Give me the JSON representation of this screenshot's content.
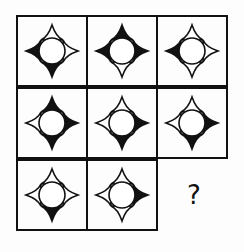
{
  "puzzle": {
    "grid": {
      "rows": 3,
      "cols": 3,
      "left": 16,
      "top": 15,
      "cell_size": 72
    },
    "colors": {
      "line": "#111111",
      "fill_black": "#111111",
      "fill_white": "#ffffff"
    },
    "cells": [
      {
        "row": 0,
        "col": 0,
        "points": {
          "top": "white",
          "right": "white",
          "bottom": "black",
          "left": "black"
        }
      },
      {
        "row": 0,
        "col": 1,
        "points": {
          "top": "black",
          "right": "black",
          "bottom": "white",
          "left": "black"
        }
      },
      {
        "row": 0,
        "col": 2,
        "points": {
          "top": "white",
          "right": "white",
          "bottom": "white",
          "left": "black"
        }
      },
      {
        "row": 1,
        "col": 0,
        "points": {
          "top": "black",
          "right": "black",
          "bottom": "black",
          "left": "white"
        }
      },
      {
        "row": 1,
        "col": 1,
        "points": {
          "top": "white",
          "right": "black",
          "bottom": "black",
          "left": "white"
        }
      },
      {
        "row": 1,
        "col": 2,
        "points": {
          "top": "white",
          "right": "black",
          "bottom": "black",
          "left": "white"
        }
      },
      {
        "row": 2,
        "col": 0,
        "points": {
          "top": "white",
          "right": "white",
          "bottom": "black",
          "left": "white"
        }
      },
      {
        "row": 2,
        "col": 1,
        "points": {
          "top": "white",
          "right": "black",
          "bottom": "white",
          "left": "white"
        }
      },
      {
        "row": 2,
        "col": 2,
        "missing": true,
        "label": "?"
      }
    ]
  }
}
